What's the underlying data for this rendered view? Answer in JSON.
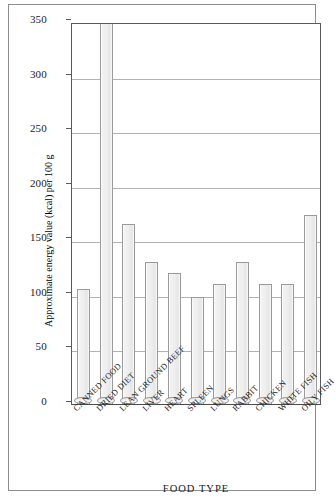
{
  "chart_data": {
    "type": "bar",
    "title": "",
    "xlabel": "FOOD TYPE",
    "ylabel": "Approximate energy value (kcal) per 100 g",
    "ylim": [
      0,
      350
    ],
    "ytick_labels": [
      "0",
      "50",
      "100",
      "150",
      "200",
      "250",
      "300",
      "350"
    ],
    "ytick_values": [
      0,
      50,
      100,
      150,
      200,
      250,
      300,
      350
    ],
    "grid": true,
    "legend": "none",
    "categories": [
      "CANNED FOOD",
      "DRIED DIET",
      "LEAN GROUND BEEF",
      "LIVER",
      "HEART",
      "SPLEEN",
      "LUNGS",
      "RABBIT",
      "CHICKEN",
      "WHITE FISH",
      "OILY FISH"
    ],
    "values": [
      105,
      360,
      165,
      130,
      120,
      98,
      110,
      130,
      110,
      110,
      173
    ],
    "colors": {
      "bar_fill": "#eeeeee",
      "bar_edge": "#9a9a9a",
      "gridline": "#b2b2b2",
      "axis": "#5a5a5a",
      "frame": "#8d8d8d",
      "text": "#1a1a1a",
      "background": "#ffffff"
    }
  }
}
